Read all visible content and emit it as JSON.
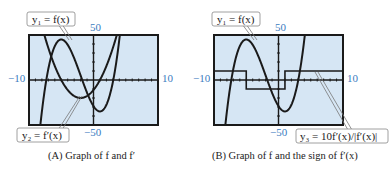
{
  "chart_data": [
    {
      "type": "line",
      "panel": "A",
      "title": "Graph of f and f'",
      "caption_prefix": "(A)",
      "xlim": [
        -10,
        10
      ],
      "ylim": [
        -50,
        50
      ],
      "grid": false,
      "tick_labels": {
        "xmin": "−10",
        "xmax": "10",
        "ymax": "50",
        "ymin": "−50"
      },
      "series": [
        {
          "name": "y1 = f(x)",
          "label": "y₁ = f(x)",
          "kind": "cubic",
          "coeffs": [
            0.74,
            4.44,
            -11.1,
            -29
          ]
        },
        {
          "name": "y2 = f'(x)",
          "label": "y₂ = f′(x)",
          "kind": "quadratic",
          "coeffs": [
            2.22,
            8.88,
            -11.1
          ]
        }
      ]
    },
    {
      "type": "line",
      "panel": "B",
      "title": "Graph of f and the sign of f'(x)",
      "caption_prefix": "(B)",
      "xlim": [
        -10,
        10
      ],
      "ylim": [
        -50,
        50
      ],
      "grid": false,
      "tick_labels": {
        "xmin": "−10",
        "xmax": "10",
        "ymax": "50",
        "ymin": "−50"
      },
      "series": [
        {
          "name": "y1 = f(x)",
          "label": "y₁ = f(x)",
          "kind": "cubic",
          "coeffs": [
            0.74,
            4.44,
            -11.1,
            -29
          ]
        },
        {
          "name": "y3 = 10f'(x)/|f'(x)|",
          "label": "y₃ = 10f′(x)/|f′(x)|",
          "kind": "step",
          "values": [
            {
              "x_from": -10,
              "x_to": -5,
              "y": 10
            },
            {
              "x_from": -5,
              "x_to": 1,
              "y": -10
            },
            {
              "x_from": 1,
              "x_to": 10,
              "y": 10
            }
          ]
        }
      ]
    }
  ],
  "captions": {
    "a": "(A)  Graph of f and f′",
    "b": "(B)  Graph of f and the sign of f′(x)"
  },
  "colors": {
    "screen_bg": "#d6e6f4",
    "axis": "#1a1a1a",
    "tick_label": "#3a7cc0",
    "curve": "#1a1a1a"
  }
}
